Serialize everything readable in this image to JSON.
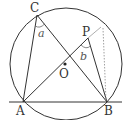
{
  "diagram": {
    "type": "geometry",
    "points": {
      "A": {
        "label": "A",
        "x": 23,
        "y": 102
      },
      "B": {
        "label": "B",
        "x": 107,
        "y": 102
      },
      "C": {
        "label": "C",
        "x": 37,
        "y": 15
      },
      "P": {
        "label": "P",
        "x": 88,
        "y": 38
      },
      "O": {
        "label": "O",
        "x": 65,
        "y": 64
      }
    },
    "angles": {
      "a": {
        "label": "a",
        "vertex": "C"
      },
      "b": {
        "label": "b",
        "vertex": "P"
      }
    },
    "circle": {
      "cx": 66,
      "cy": 64,
      "r": 56
    },
    "colors": {
      "line": "#333333",
      "dotted": "#888888",
      "angle": "#666666"
    }
  }
}
